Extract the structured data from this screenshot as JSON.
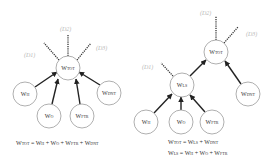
{
  "colors": {
    "node_stroke": "#9a9a9a",
    "arrow": "#222222",
    "dashed": "#333333",
    "dlabel": "#b8b8b8",
    "text": "#333333"
  },
  "left_diagram": {
    "nodes": {
      "tot": {
        "main": "W",
        "sub": "TOT"
      },
      "h": {
        "main": "W",
        "sub": "H"
      },
      "o": {
        "main": "W",
        "sub": "O"
      },
      "ftr": {
        "main": "W",
        "sub": "FTR"
      },
      "dnt": {
        "main": "W",
        "sub": "DNT"
      }
    },
    "dlabels": {
      "d1": "(D1)",
      "d2": "(D2)",
      "d3": "(D3)"
    },
    "equation": {
      "lhs_main": "W",
      "lhs_sub": "TOT",
      "t1_main": "W",
      "t1_sub": "H",
      "t2_main": "W",
      "t2_sub": "O",
      "t3_main": "W",
      "t3_sub": "FTR",
      "t4_main": "W",
      "t4_sub": "DNT",
      "eq": " = ",
      "plus": " + "
    }
  },
  "right_diagram": {
    "nodes": {
      "tot": {
        "main": "W",
        "sub": "TOT"
      },
      "ls": {
        "main": "W",
        "sub": "LS"
      },
      "dnt": {
        "main": "W",
        "sub": "DNT"
      },
      "h": {
        "main": "W",
        "sub": "H"
      },
      "o": {
        "main": "W",
        "sub": "O"
      },
      "ftr": {
        "main": "W",
        "sub": "FTR"
      }
    },
    "dlabels": {
      "d1": "(D1)",
      "d2": "(D2)",
      "d3": "(D3)"
    },
    "equation1": {
      "lhs_main": "W",
      "lhs_sub": "TOT",
      "t1_main": "W",
      "t1_sub": "LS",
      "t2_main": "W",
      "t2_sub": "DNT",
      "eq": " = ",
      "plus": " + "
    },
    "equation2": {
      "lhs_main": "W",
      "lhs_sub": "LS",
      "t1_main": "W",
      "t1_sub": "H",
      "t2_main": "W",
      "t2_sub": "O",
      "t3_main": "W",
      "t3_sub": "FTR",
      "eq": " = ",
      "plus": " + "
    }
  }
}
